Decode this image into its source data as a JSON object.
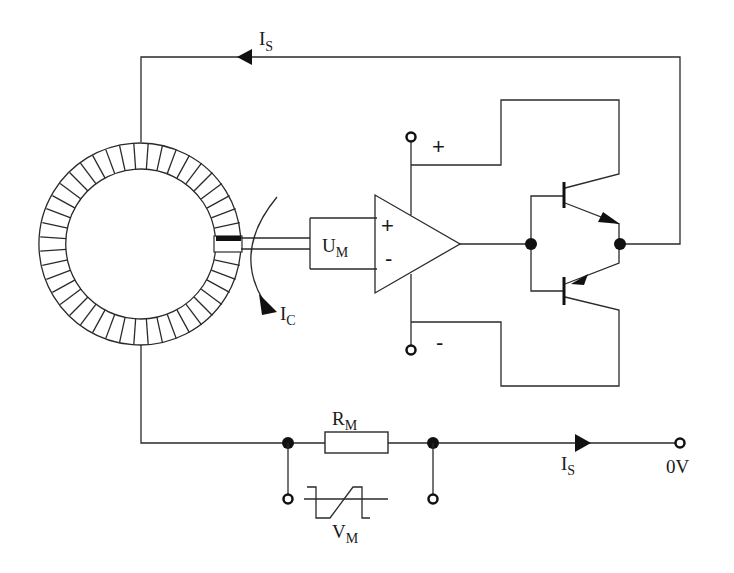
{
  "diagram": {
    "type": "circuit-schematic",
    "labels": {
      "is_top": {
        "main": "I",
        "sub": "S"
      },
      "ic": {
        "main": "I",
        "sub": "C"
      },
      "um": {
        "main": "U",
        "sub": "M"
      },
      "rm": {
        "main": "R",
        "sub": "M"
      },
      "vm": {
        "main": "V",
        "sub": "M"
      },
      "is_bottom": {
        "main": "I",
        "sub": "S"
      },
      "zero_v": "0V",
      "opamp_plus": "+",
      "opamp_minus": "-",
      "supply_plus": "+",
      "supply_minus": "-"
    },
    "components": [
      {
        "id": "toroid-core",
        "label": "winding core with air gap"
      },
      {
        "id": "hall-sensor",
        "label": "Hall element in gap"
      },
      {
        "id": "um-box",
        "label": "U_M"
      },
      {
        "id": "opamp",
        "label": "operational amplifier"
      },
      {
        "id": "npn-transistor",
        "label": "upper transistor"
      },
      {
        "id": "pnp-transistor",
        "label": "lower transistor"
      },
      {
        "id": "rm-resistor",
        "label": "R_M"
      },
      {
        "id": "vm-scope",
        "label": "V_M waveform"
      }
    ],
    "colors": {
      "line": "#2a2a2a",
      "background": "#ffffff"
    }
  }
}
